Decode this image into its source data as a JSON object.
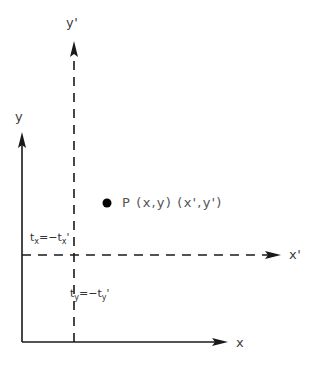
{
  "figure": {
    "type": "coordinate-frame-diagram",
    "background_color": "#ffffff",
    "line_color": "#1a1a1a",
    "text_color": "#4a4a4a",
    "width": 314,
    "height": 367
  },
  "axes": {
    "primary_frame": {
      "origin": [
        22,
        342
      ],
      "style": "solid",
      "x_label": "x",
      "y_label": "y",
      "x_axis_end": [
        232,
        342
      ],
      "y_axis_end": [
        22,
        132
      ]
    },
    "transformed_frame": {
      "origin": [
        74,
        255
      ],
      "style": "dashed",
      "x_label": "x'",
      "y_label": "y'",
      "x_axis_end": [
        285,
        255
      ],
      "y_axis_end": [
        74,
        40
      ]
    }
  },
  "point": {
    "marker_name": "P",
    "label": "P  (x,y)  (x',y')",
    "coords_primary": "(x,y)",
    "coords_transformed": "(x',y')",
    "position": [
      107,
      203
    ],
    "radius": 4.5
  },
  "offsets": {
    "x_offset": {
      "text": "t",
      "sub": "x",
      "relation": "=−t",
      "sub2": "x",
      "prime": "'",
      "full": "tₓ=−tₓ'",
      "position": [
        30,
        234
      ]
    },
    "y_offset": {
      "text": "t",
      "sub": "y",
      "relation": "=−t",
      "sub2": "y",
      "prime": "'",
      "full": "tᵧ=−tᵧ'",
      "position": [
        70,
        290
      ]
    }
  },
  "labels": {
    "y_prime_top": "y'",
    "x_prime_right": "x'",
    "y_plain": "y",
    "x_plain": "x"
  }
}
